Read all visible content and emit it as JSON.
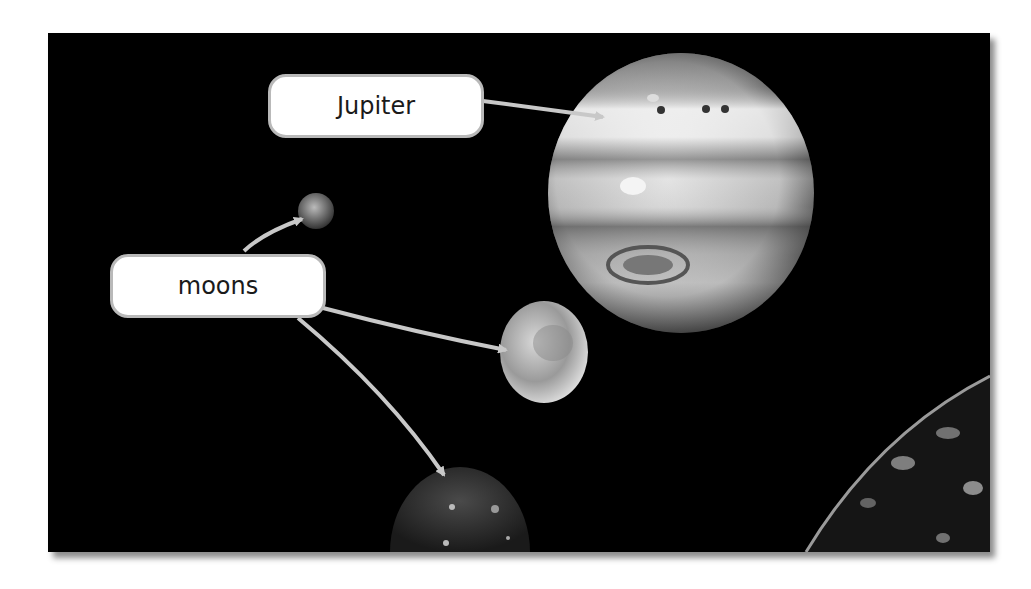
{
  "figure": {
    "background_color": "#000000",
    "labels": {
      "jupiter": "Jupiter",
      "moons": "moons"
    },
    "arrow_color": "#c8c8c8",
    "objects": [
      {
        "name": "Jupiter",
        "type": "planet"
      },
      {
        "name": "small moon",
        "type": "moon"
      },
      {
        "name": "medium moon",
        "type": "moon"
      },
      {
        "name": "lower moon",
        "type": "moon"
      },
      {
        "name": "large moon (corner)",
        "type": "moon"
      }
    ]
  }
}
